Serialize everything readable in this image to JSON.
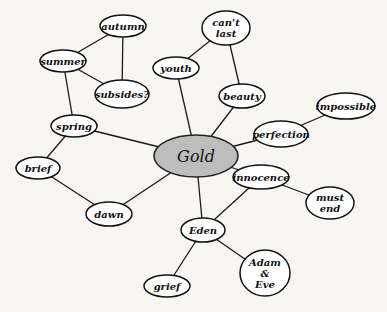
{
  "diagram": {
    "type": "mind-map",
    "center": {
      "id": "gold",
      "label": "Gold",
      "x": 196,
      "y": 156,
      "rx": 42,
      "ry": 21,
      "fill": "#bdbdbd"
    },
    "nodes": [
      {
        "id": "autumn",
        "lines": [
          "autumn"
        ],
        "x": 123,
        "y": 26,
        "rx": 23,
        "ry": 11
      },
      {
        "id": "summer",
        "lines": [
          "summer"
        ],
        "x": 63,
        "y": 61,
        "rx": 23,
        "ry": 11
      },
      {
        "id": "subsides",
        "lines": [
          "subsides?"
        ],
        "x": 122,
        "y": 94,
        "rx": 27,
        "ry": 14
      },
      {
        "id": "youth",
        "lines": [
          "youth"
        ],
        "x": 176,
        "y": 68,
        "rx": 23,
        "ry": 11
      },
      {
        "id": "cant-last",
        "lines": [
          "can't",
          "last"
        ],
        "x": 226,
        "y": 28,
        "rx": 24,
        "ry": 17
      },
      {
        "id": "beauty",
        "lines": [
          "beauty"
        ],
        "x": 242,
        "y": 96,
        "rx": 23,
        "ry": 12
      },
      {
        "id": "impossible",
        "lines": [
          "impossible"
        ],
        "x": 346,
        "y": 106,
        "rx": 29,
        "ry": 13
      },
      {
        "id": "perfection",
        "lines": [
          "perfection"
        ],
        "x": 281,
        "y": 134,
        "rx": 27,
        "ry": 13
      },
      {
        "id": "spring",
        "lines": [
          "spring"
        ],
        "x": 74,
        "y": 126,
        "rx": 23,
        "ry": 11
      },
      {
        "id": "brief",
        "lines": [
          "brief"
        ],
        "x": 38,
        "y": 168,
        "rx": 22,
        "ry": 11
      },
      {
        "id": "innocence",
        "lines": [
          "innocence"
        ],
        "x": 261,
        "y": 177,
        "rx": 28,
        "ry": 12
      },
      {
        "id": "must-end",
        "lines": [
          "must",
          "end"
        ],
        "x": 330,
        "y": 203,
        "rx": 24,
        "ry": 16
      },
      {
        "id": "dawn",
        "lines": [
          "dawn"
        ],
        "x": 109,
        "y": 214,
        "rx": 23,
        "ry": 12
      },
      {
        "id": "eden",
        "lines": [
          "Eden"
        ],
        "x": 203,
        "y": 230,
        "rx": 22,
        "ry": 12
      },
      {
        "id": "adam-eve",
        "lines": [
          "Adam",
          "&",
          "Eve"
        ],
        "x": 265,
        "y": 273,
        "rx": 25,
        "ry": 23
      },
      {
        "id": "grief",
        "lines": [
          "grief"
        ],
        "x": 167,
        "y": 286,
        "rx": 23,
        "ry": 11
      }
    ],
    "edges": [
      [
        "gold",
        "spring"
      ],
      [
        "gold",
        "youth"
      ],
      [
        "gold",
        "beauty"
      ],
      [
        "gold",
        "perfection"
      ],
      [
        "gold",
        "innocence"
      ],
      [
        "gold",
        "eden"
      ],
      [
        "gold",
        "dawn"
      ],
      [
        "spring",
        "summer"
      ],
      [
        "spring",
        "brief"
      ],
      [
        "brief",
        "dawn"
      ],
      [
        "summer",
        "autumn"
      ],
      [
        "summer",
        "subsides"
      ],
      [
        "autumn",
        "subsides"
      ],
      [
        "youth",
        "cant-last"
      ],
      [
        "beauty",
        "cant-last"
      ],
      [
        "perfection",
        "impossible"
      ],
      [
        "innocence",
        "must-end"
      ],
      [
        "innocence",
        "eden"
      ],
      [
        "eden",
        "adam-eve"
      ],
      [
        "eden",
        "grief"
      ]
    ]
  }
}
